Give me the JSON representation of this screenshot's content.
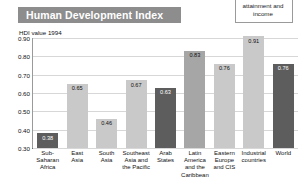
{
  "title": "Human Development Index",
  "legend_note": "attainment and income",
  "axis_caption": "HDI value 1994",
  "chart_data": {
    "type": "bar",
    "title": "Human Development Index",
    "xlabel": "",
    "ylabel": "HDI value 1994",
    "ylim": [
      0.3,
      0.9
    ],
    "grid": true,
    "legend_position": "top-right",
    "yticks": [
      "0.90",
      "0.80",
      "0.70",
      "0.60",
      "0.50",
      "0.40",
      "0.30"
    ],
    "categories": [
      "Sub-\nSaharan\nAfrica",
      "East\nAsia",
      "South\nAsia",
      "Southeast\nAsia and\nthe Pacific",
      "Arab\nStates",
      "Latin\nAmerica\nand the\nCaribbean",
      "Eastern\nEurope\nand CIS",
      "Industrial\ncountries",
      "World"
    ],
    "values": [
      0.38,
      0.65,
      0.46,
      0.67,
      0.63,
      0.83,
      0.76,
      0.91,
      0.76
    ],
    "value_labels": [
      "0.38",
      "0.65",
      "0.46",
      "0.67",
      "0.63",
      "0.83",
      "0.76",
      "0.91",
      "0.76"
    ],
    "bar_shades": [
      "dark",
      "light",
      "light",
      "light",
      "dark",
      "mid",
      "light",
      "light",
      "dark"
    ]
  }
}
